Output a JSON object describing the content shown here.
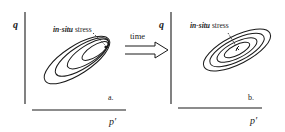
{
  "panels": [
    {
      "id": "a",
      "y_axis_label": "q",
      "x_axis_label": "p′",
      "panel_label": "a.",
      "annotation": {
        "italic_part": "in-situ",
        "rest": " stress"
      },
      "contour_style": "nested-converging"
    },
    {
      "id": "b",
      "y_axis_label": "q",
      "x_axis_label": "p′",
      "panel_label": "b.",
      "annotation": {
        "italic_part": "in-situ",
        "rest": " stress"
      },
      "contour_style": "concentric"
    }
  ],
  "transition": {
    "label": "time",
    "icon": "hollow-right-arrow-icon"
  },
  "colors": {
    "ink": "#1a1a1a",
    "background": "#ffffff"
  }
}
